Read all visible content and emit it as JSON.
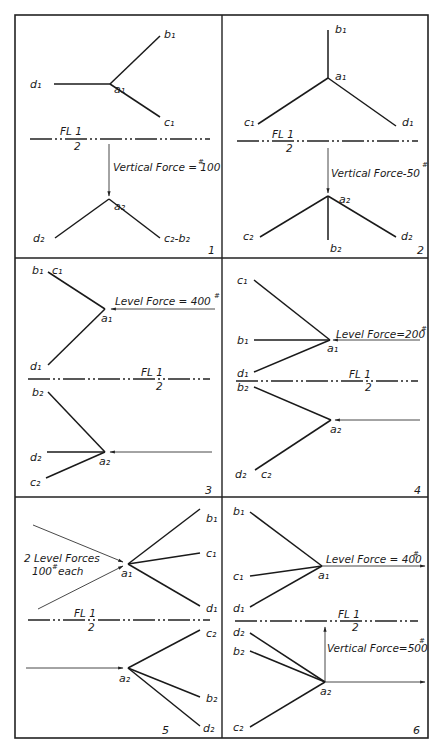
{
  "figure": {
    "folding_line": {
      "label_top": "FL 1",
      "label_bottom": "2"
    },
    "panels": [
      {
        "number": "1",
        "labels": {
          "a1": "a₁",
          "b1": "b₁",
          "c1": "c₁",
          "d1": "d₁",
          "a2": "a₂",
          "d2": "d₂",
          "c2b2": "c₂-b₂"
        },
        "force_note": "Vertical Force = 100",
        "force_unit": "#"
      },
      {
        "number": "2",
        "labels": {
          "a1": "a₁",
          "b1": "b₁",
          "c1": "c₁",
          "d1": "d₁",
          "a2": "a₂",
          "b2": "b₂",
          "c2": "c₂",
          "d2": "d₂"
        },
        "force_note": "Vertical Force-50",
        "force_unit": "#"
      },
      {
        "number": "3",
        "labels": {
          "b1c1": "b₁",
          "c1": "c₁",
          "a1": "a₁",
          "d1": "d₁",
          "b2": "b₂",
          "d2": "d₂",
          "a2": "a₂",
          "c2": "c₂"
        },
        "force_note": "Level Force = 400",
        "force_unit": "#"
      },
      {
        "number": "4",
        "labels": {
          "c1": "c₁",
          "b1": "b₁",
          "a1": "a₁",
          "d1": "d₁",
          "b2": "b₂",
          "a2": "a₂",
          "d2": "d₂",
          "c2": "c₂"
        },
        "force_note": "Level Force=200",
        "force_unit": "#"
      },
      {
        "number": "5",
        "labels": {
          "b1": "b₁",
          "c1": "c₁",
          "a1": "a₁",
          "d1": "d₁",
          "c2": "c₂",
          "a2": "a₂",
          "b2": "b₂",
          "d2": "d₂"
        },
        "force_note_line1": "2 Level Forces",
        "force_note_line2": "100",
        "force_note_unit": "#",
        "force_note_line2_suffix": "each"
      },
      {
        "number": "6",
        "labels": {
          "b1": "b₁",
          "c1": "c₁",
          "a1": "a₁",
          "d1": "d₁",
          "d2": "d₂",
          "b2": "b₂",
          "a2": "a₂",
          "c2": "c₂"
        },
        "force_note": "Level Force = 400",
        "force_unit": "#",
        "force_note_2": "Vertical Force=500",
        "force_unit_2": "#"
      }
    ]
  }
}
